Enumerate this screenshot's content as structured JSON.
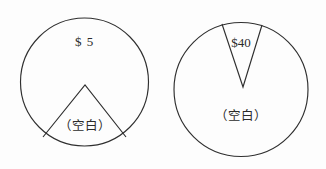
{
  "figure": {
    "background_color": "#fdfdfd",
    "stroke_color": "#2f2f2f",
    "text_color": "#2b2b2b",
    "shapes": [
      {
        "name": "left-circle",
        "type": "circle-with-triangular-notch",
        "center_x": 84.5,
        "center_y": 82,
        "radius": 64,
        "amount_label": "$ 5",
        "blank_label": "（空白）",
        "notch": {
          "apex_x": 85,
          "apex_y": 85,
          "left_foot_x": 43,
          "left_foot_y": 137,
          "right_foot_x": 126,
          "right_foot_y": 137
        }
      },
      {
        "name": "right-circle",
        "type": "circle-with-narrow-wedge",
        "center_x": 241,
        "center_y": 89.5,
        "radius": 67,
        "amount_label": "$40",
        "blank_label": "（空白）",
        "wedge": {
          "apex_x": 243,
          "apex_y": 87,
          "left_top_x": 222,
          "left_top_y": 24,
          "right_top_x": 262,
          "right_top_y": 25
        }
      }
    ]
  }
}
